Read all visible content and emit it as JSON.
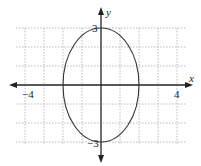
{
  "figure": {
    "type": "ellipse-graph",
    "equation_shape": "vertical ellipse centered at origin",
    "x_axis_label": "x",
    "y_axis_label": "y",
    "x_tick_labels": {
      "left": "−4",
      "right": "4"
    },
    "y_tick_labels": {
      "top": "3",
      "bottom": "−3"
    },
    "grid": {
      "x_range": [
        -4,
        4
      ],
      "y_range": [
        -3,
        3
      ],
      "step": 1
    },
    "ellipse": {
      "center": [
        0,
        0
      ],
      "semi_x": 2,
      "semi_y": 3
    },
    "colors": {
      "axis": "#222222",
      "grid": "#999999",
      "curve": "#333333"
    }
  }
}
